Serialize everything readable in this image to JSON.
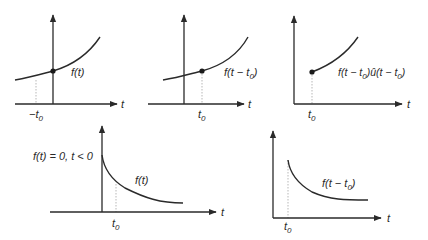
{
  "figure": {
    "panels": [
      {
        "id": "shift-left",
        "curve_label": "f(t)",
        "axis_label": "t",
        "tick_label": "−t",
        "tick_sub": "0"
      },
      {
        "id": "shift-right",
        "curve_label_pre": "f(t − t",
        "curve_label_sub": "0",
        "curve_label_post": ")",
        "axis_label": "t",
        "tick_label": "t",
        "tick_sub": "0"
      },
      {
        "id": "shift-right-truncated",
        "curve_label_a": "f(t − t",
        "curve_label_a_sub": "0",
        "curve_label_b": ")û(t − t",
        "curve_label_b_sub": "0",
        "curve_label_c": ")",
        "axis_label": "t",
        "tick_label": "t",
        "tick_sub": "0"
      },
      {
        "id": "causal-decay",
        "condition_label": "f(t) = 0, t < 0",
        "curve_label": "f(t)",
        "axis_label": "t",
        "tick_label": "t",
        "tick_sub": "0"
      },
      {
        "id": "causal-decay-shifted",
        "curve_label_pre": "f(t − t",
        "curve_label_sub": "0",
        "curve_label_post": ")",
        "axis_label": "t",
        "tick_label": "t",
        "tick_sub": "0"
      }
    ]
  }
}
